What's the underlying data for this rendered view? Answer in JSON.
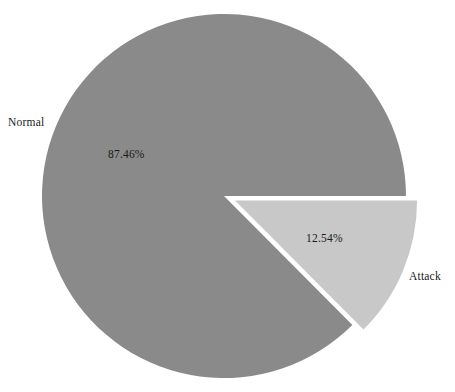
{
  "chart_data": {
    "type": "pie",
    "title": "",
    "categories": [
      "Normal",
      "Attack"
    ],
    "values": [
      87.46,
      12.54
    ],
    "value_labels": [
      "87.46%",
      "12.54%"
    ],
    "units": "percent",
    "legend": "none",
    "slices": [
      {
        "name": "Normal",
        "label": "Normal",
        "percent": 87.46,
        "percent_label": "87.46%",
        "color": "#8a8a8a",
        "exploded": false
      },
      {
        "name": "Attack",
        "label": "Attack",
        "percent": 12.54,
        "percent_label": "12.54%",
        "color": "#c8c8c8",
        "exploded": true
      }
    ]
  },
  "colors": {
    "normal_slice": "#8a8a8a",
    "attack_slice": "#c8c8c8",
    "background": "#ffffff",
    "text": "#1a1a1a"
  }
}
